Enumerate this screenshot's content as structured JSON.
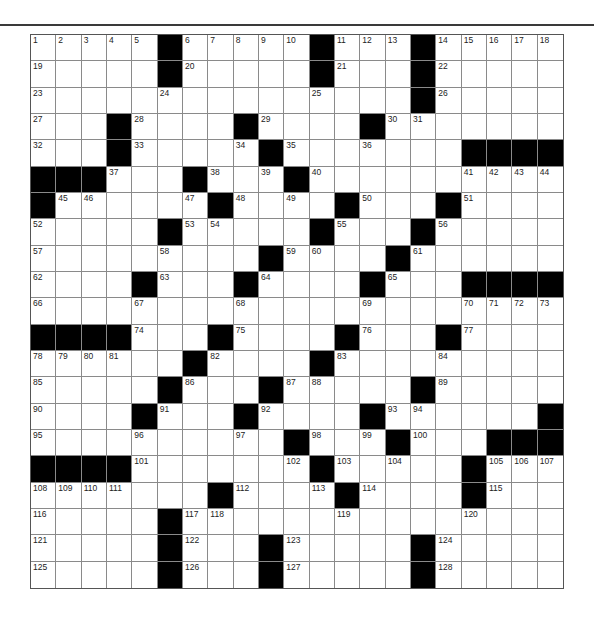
{
  "puzzle": {
    "rows": 21,
    "cols": 21,
    "colors": {
      "block": "#000000",
      "cell": "#ffffff",
      "grid_line": "#8a8a8a",
      "rule": "#3a3a3a"
    },
    "grid": [
      [
        "1",
        "2",
        "3",
        "4",
        "5",
        "#",
        "6",
        "7",
        "8",
        "9",
        "10",
        "#",
        "11",
        "12",
        "13",
        "#",
        "14",
        "15",
        "16",
        "17",
        "18"
      ],
      [
        "19",
        "",
        "",
        "",
        "",
        "#",
        "20",
        "",
        "",
        "",
        "",
        "#",
        "21",
        "",
        "",
        "#",
        "22",
        "",
        "",
        "",
        ""
      ],
      [
        "23",
        "",
        "",
        "",
        "",
        "24",
        "",
        "",
        "",
        "",
        "",
        "25",
        "",
        "",
        "",
        "#",
        "26",
        "",
        "",
        "",
        ""
      ],
      [
        "27",
        "",
        "",
        "#",
        "28",
        "",
        "",
        "",
        "#",
        "29",
        "",
        "",
        "",
        "#",
        "30",
        "31",
        "",
        "",
        "",
        "",
        ""
      ],
      [
        "32",
        "",
        "",
        "#",
        "33",
        "",
        "",
        "",
        "34",
        "#",
        "35",
        "",
        "",
        "36",
        "",
        "",
        "",
        "#",
        "#",
        "#",
        "#"
      ],
      [
        "#",
        "#",
        "#",
        "37",
        "",
        "",
        "#",
        "38",
        "",
        "39",
        "#",
        "40",
        "",
        "",
        "",
        "",
        "",
        "41",
        "42",
        "43",
        "44"
      ],
      [
        "#",
        "45",
        "46",
        "",
        "",
        "",
        "47",
        "#",
        "48",
        "",
        "49",
        "",
        "#",
        "50",
        "",
        "",
        "#",
        "51",
        "",
        "",
        ""
      ],
      [
        "52",
        "",
        "",
        "",
        "",
        "#",
        "53",
        "54",
        "",
        "",
        "",
        "#",
        "55",
        "",
        "",
        "#",
        "56",
        "",
        "",
        "",
        ""
      ],
      [
        "57",
        "",
        "",
        "",
        "",
        "58",
        "",
        "",
        "",
        "#",
        "59",
        "60",
        "",
        "",
        "#",
        "61",
        "",
        "",
        "",
        "",
        ""
      ],
      [
        "62",
        "",
        "",
        "",
        "#",
        "63",
        "",
        "",
        "#",
        "64",
        "",
        "",
        "",
        "#",
        "65",
        "",
        "",
        "#",
        "#",
        "#",
        "#"
      ],
      [
        "66",
        "",
        "",
        "",
        "67",
        "",
        "",
        "",
        "68",
        "",
        "",
        "",
        "",
        "69",
        "",
        "",
        "",
        "70",
        "71",
        "72",
        "73"
      ],
      [
        "#",
        "#",
        "#",
        "#",
        "74",
        "",
        "",
        "#",
        "75",
        "",
        "",
        "",
        "#",
        "76",
        "",
        "",
        "#",
        "77",
        "",
        "",
        ""
      ],
      [
        "78",
        "79",
        "80",
        "81",
        "",
        "",
        "#",
        "82",
        "",
        "",
        "",
        "#",
        "83",
        "",
        "",
        "",
        "84",
        "",
        "",
        "",
        ""
      ],
      [
        "85",
        "",
        "",
        "",
        "",
        "#",
        "86",
        "",
        "",
        "#",
        "87",
        "88",
        "",
        "",
        "",
        "#",
        "89",
        "",
        "",
        "",
        ""
      ],
      [
        "90",
        "",
        "",
        "",
        "#",
        "91",
        "",
        "",
        "#",
        "92",
        "",
        "",
        "",
        "#",
        "93",
        "94",
        "",
        "",
        "",
        "",
        "#"
      ],
      [
        "95",
        "",
        "",
        "",
        "96",
        "",
        "",
        "",
        "97",
        "",
        "#",
        "98",
        "",
        "99",
        "#",
        "100",
        "",
        "",
        "#",
        "#",
        "#"
      ],
      [
        "#",
        "#",
        "#",
        "#",
        "101",
        "",
        "",
        "",
        "",
        "",
        "102",
        "#",
        "103",
        "",
        "104",
        "",
        "",
        "#",
        "105",
        "106",
        "107"
      ],
      [
        "108",
        "109",
        "110",
        "111",
        "",
        "",
        "",
        "#",
        "112",
        "",
        "",
        "113",
        "#",
        "114",
        "",
        "",
        "",
        "#",
        "115",
        "",
        ""
      ],
      [
        "116",
        "",
        "",
        "",
        "",
        "#",
        "117",
        "118",
        "",
        "",
        "",
        "",
        "119",
        "",
        "",
        "",
        "",
        "120",
        "",
        "",
        ""
      ],
      [
        "121",
        "",
        "",
        "",
        "",
        "#",
        "122",
        "",
        "",
        "#",
        "123",
        "",
        "",
        "",
        "",
        "#",
        "124",
        "",
        "",
        "",
        ""
      ],
      [
        "125",
        "",
        "",
        "",
        "",
        "#",
        "126",
        "",
        "",
        "#",
        "127",
        "",
        "",
        "",
        "",
        "#",
        "128",
        "",
        "",
        "",
        ""
      ]
    ]
  }
}
